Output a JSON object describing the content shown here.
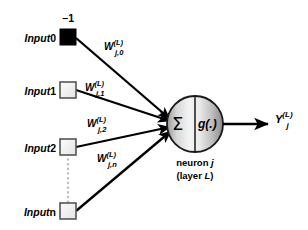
{
  "diagram": {
    "background_color": "#ffffff",
    "line_color": "#000000",
    "node_fill_bias": "#000000",
    "node_fill_input": "#f2f2f2",
    "node_stroke": "#4d4d4d",
    "neuron_gradient_light": "#f7f7f7",
    "neuron_gradient_dark": "#8c8c8c",
    "dotted_line_color": "#bdbdbd"
  },
  "inputs": [
    {
      "label_prefix": "Input",
      "label_index": "0",
      "value_above": "−1",
      "kind": "bias",
      "weight_base": "W",
      "weight_sup": "(L)",
      "weight_sub": "j,0"
    },
    {
      "label_prefix": "Input",
      "label_index": "1",
      "value_above": "",
      "kind": "signal",
      "weight_base": "W",
      "weight_sup": "(L)",
      "weight_sub": "j,1"
    },
    {
      "label_prefix": "Input",
      "label_index": "2",
      "value_above": "",
      "kind": "signal",
      "weight_base": "W",
      "weight_sup": "(L)",
      "weight_sub": "j,2"
    },
    {
      "label_prefix": "Input",
      "label_index": "n",
      "value_above": "",
      "kind": "signal",
      "weight_base": "W",
      "weight_sup": "(L)",
      "weight_sub": "j,n"
    }
  ],
  "neuron": {
    "summation_symbol": "Σ",
    "activation_symbol": "g(.)",
    "caption_line1_text": "neuron ",
    "caption_line1_italic": "j",
    "caption_line2_open": "(layer ",
    "caption_line2_italic": "L",
    "caption_line2_close": ")"
  },
  "output": {
    "base": "Y",
    "superscript": "(L)",
    "subscript": "j"
  }
}
